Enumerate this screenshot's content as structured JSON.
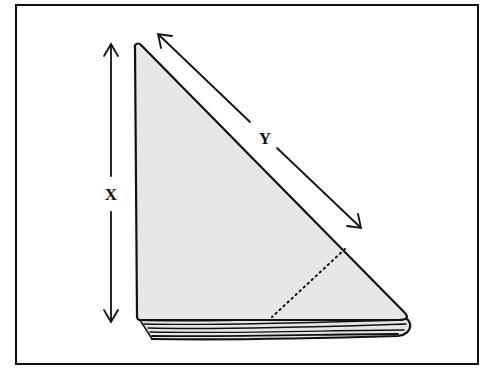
{
  "diagram": {
    "labels": {
      "x": "X",
      "y": "Y"
    },
    "colors": {
      "stroke": "#111111",
      "fill": "#e6e6e6",
      "background": "#ffffff"
    }
  }
}
